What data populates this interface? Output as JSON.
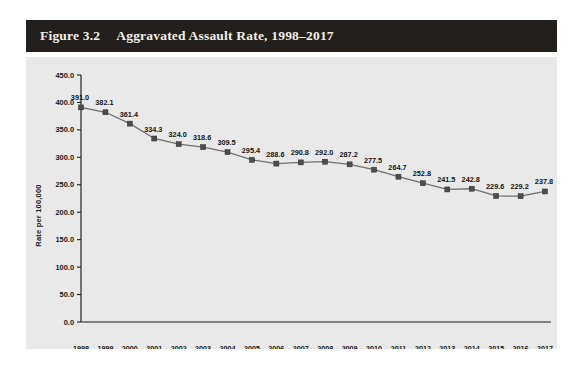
{
  "figure": {
    "number": "Figure 3.2",
    "title": "Aggravated Assault Rate, 1998–2017",
    "header_bg": "#231f1c",
    "header_text_color": "#f2efe9",
    "panel_bg": "#e9e9e9",
    "page_bg": "#ffffff"
  },
  "chart_data": {
    "type": "line",
    "title": "Aggravated Assault Rate, 1998–2017",
    "xlabel": "",
    "ylabel": "Rate per 100,000",
    "categories": [
      "1998",
      "1999",
      "2000",
      "2001",
      "2002",
      "2003",
      "2004",
      "2005",
      "2006",
      "2007",
      "2008",
      "2009",
      "2010",
      "2011",
      "2012",
      "2013",
      "2014",
      "2015",
      "2016",
      "2017"
    ],
    "values": [
      391.0,
      382.1,
      361.4,
      334.3,
      324.0,
      318.6,
      309.5,
      295.4,
      288.6,
      290.8,
      292.0,
      287.2,
      277.5,
      264.7,
      252.8,
      241.5,
      242.8,
      229.6,
      229.2,
      237.8
    ],
    "data_labels": [
      "391.0",
      "382.1",
      "361.4",
      "334.3",
      "324.0",
      "318.6",
      "309.5",
      "295.4",
      "288.6",
      "290.8",
      "292.0",
      "287.2",
      "277.5",
      "264.7",
      "252.8",
      "241.5",
      "242.8",
      "229.6",
      "229.2",
      "237.8"
    ],
    "ylim": [
      0,
      450
    ],
    "ytick_step": 50,
    "ytick_labels": [
      "0.0",
      "50.0",
      "100.0",
      "150.0",
      "200.0",
      "250.0",
      "300.0",
      "350.0",
      "400.0",
      "450.0"
    ],
    "grid": false,
    "legend": null,
    "marker": "square",
    "line_color": "#6f6f6f",
    "marker_color": "#4d4d4d"
  }
}
